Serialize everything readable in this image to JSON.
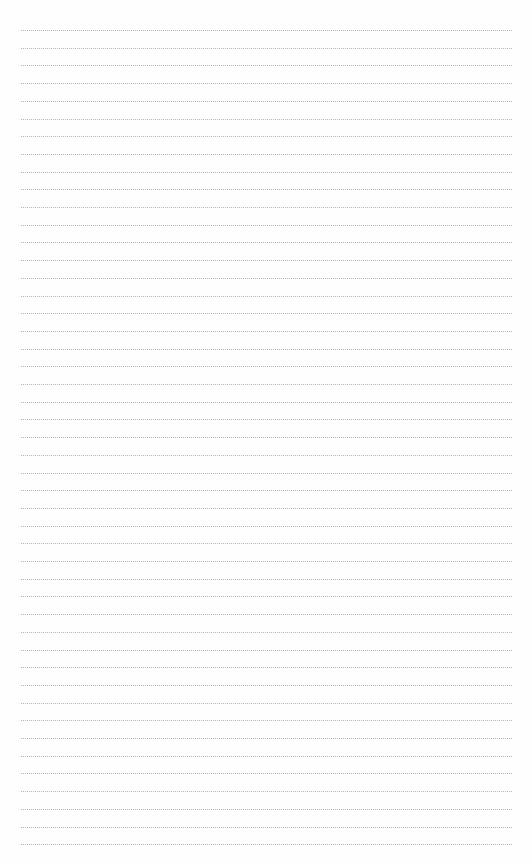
{
  "page": {
    "type": "lined-paper",
    "background": "#fefefe",
    "line_color": "#b4b4b4",
    "line_style": "dotted",
    "line_count": 47,
    "first_line_y": 30,
    "line_spacing": 17.7,
    "line_left": 21,
    "line_right": 512
  }
}
